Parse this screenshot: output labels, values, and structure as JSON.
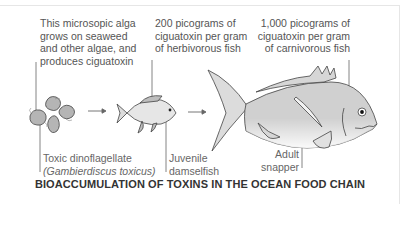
{
  "annotations": {
    "alga": [
      "This microsopic alga",
      "grows on seaweed",
      "and other algae, and",
      "produces ciguatoxin"
    ],
    "herbivore": [
      "200 picograms of",
      "ciguatoxin per gram",
      "of herbivorous fish"
    ],
    "carnivore": [
      "1,000 picograms of",
      "ciguatoxin per gram",
      "of carnivorous fish"
    ]
  },
  "labels": {
    "dinoflagellate": "Toxic dinoflagellate",
    "dinoflagellate_species": "(Gambierdiscus toxicus)",
    "damselfish_1": "Juvenile",
    "damselfish_2": "damselfish",
    "snapper_1": "Adult",
    "snapper_2": "snapper"
  },
  "caption": "BIOACCUMULATION OF TOXINS IN THE OCEAN FOOD CHAIN",
  "colors": {
    "line": "#555555",
    "fill": "#c8c8c8",
    "text": "#555555",
    "caption": "#333333"
  },
  "flow": [
    "Toxic dinoflagellate",
    "Juvenile damselfish",
    "Adult snapper"
  ]
}
